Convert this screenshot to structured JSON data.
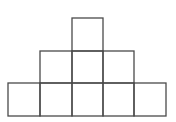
{
  "diagram": {
    "stroke_color": "#4a4a4a",
    "background": "#ffffff",
    "rows": [
      {
        "name": "top",
        "count": 1,
        "start_col": 2
      },
      {
        "name": "middle",
        "count": 3,
        "start_col": 1
      },
      {
        "name": "bottom",
        "count": 5,
        "start_col": 0
      }
    ],
    "total_squares": 9
  }
}
